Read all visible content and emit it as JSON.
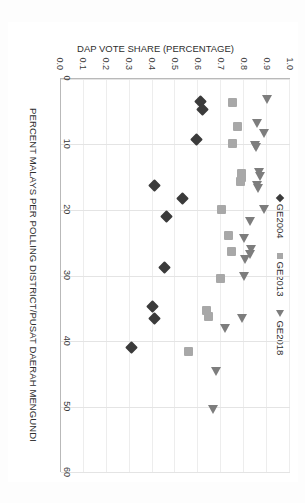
{
  "chart_data": {
    "type": "scatter",
    "title": "",
    "xlabel": "PERCENT MALAYS PER POLLING DISTRICT/PUSAT DAERAH MENGUNDI",
    "ylabel": "DAP VOTE SHARE (PERCENTAGE)",
    "xlim": [
      0,
      60
    ],
    "ylim": [
      0.0,
      1.0
    ],
    "xticks": [
      "0",
      "10",
      "20",
      "30",
      "40",
      "50",
      "60"
    ],
    "yticks": [
      "0.0",
      "0.1",
      "0.2",
      "0.3",
      "0.4",
      "0.5",
      "0.6",
      "0.7",
      "0.8",
      "0.9",
      "1.0"
    ],
    "grid": "both",
    "legend_position": "top-center",
    "series": [
      {
        "name": "GE2004",
        "marker": "diamond",
        "color": "#3b3b3b",
        "points": [
          [
            3.5,
            0.61
          ],
          [
            4.7,
            0.62
          ],
          [
            9.3,
            0.59
          ],
          [
            16.3,
            0.41
          ],
          [
            18.2,
            0.53
          ],
          [
            21.0,
            0.46
          ],
          [
            28.8,
            0.45
          ],
          [
            34.8,
            0.4
          ],
          [
            36.5,
            0.41
          ],
          [
            41.0,
            0.31
          ]
        ]
      },
      {
        "name": "GE2013",
        "marker": "square",
        "color": "#a8a8a8",
        "points": [
          [
            3.6,
            0.75
          ],
          [
            7.2,
            0.77
          ],
          [
            9.8,
            0.75
          ],
          [
            14.4,
            0.79
          ],
          [
            15.1,
            0.79
          ],
          [
            15.6,
            0.785
          ],
          [
            19.9,
            0.7
          ],
          [
            23.9,
            0.73
          ],
          [
            26.3,
            0.745
          ],
          [
            30.4,
            0.695
          ],
          [
            35.4,
            0.635
          ],
          [
            36.3,
            0.645
          ],
          [
            41.6,
            0.555
          ]
        ]
      },
      {
        "name": "GE2018",
        "marker": "triangle",
        "color": "#7d7d7d",
        "points": [
          [
            3.2,
            0.9
          ],
          [
            6.9,
            0.855
          ],
          [
            8.4,
            0.885
          ],
          [
            10.2,
            0.845
          ],
          [
            10.6,
            0.85
          ],
          [
            14.4,
            0.865
          ],
          [
            15.0,
            0.87
          ],
          [
            16.3,
            0.855
          ],
          [
            16.8,
            0.86
          ],
          [
            20.0,
            0.885
          ],
          [
            21.8,
            0.825
          ],
          [
            24.5,
            0.8
          ],
          [
            26.1,
            0.83
          ],
          [
            26.9,
            0.825
          ],
          [
            27.6,
            0.805
          ],
          [
            30.2,
            0.8
          ],
          [
            36.6,
            0.79
          ],
          [
            38.1,
            0.715
          ],
          [
            44.7,
            0.675
          ],
          [
            50.5,
            0.665
          ]
        ]
      }
    ]
  },
  "legend": {
    "items": [
      {
        "label": "GE2004",
        "marker": "diamond"
      },
      {
        "label": "GE2013",
        "marker": "square"
      },
      {
        "label": "GE2018",
        "marker": "triangle"
      }
    ]
  }
}
